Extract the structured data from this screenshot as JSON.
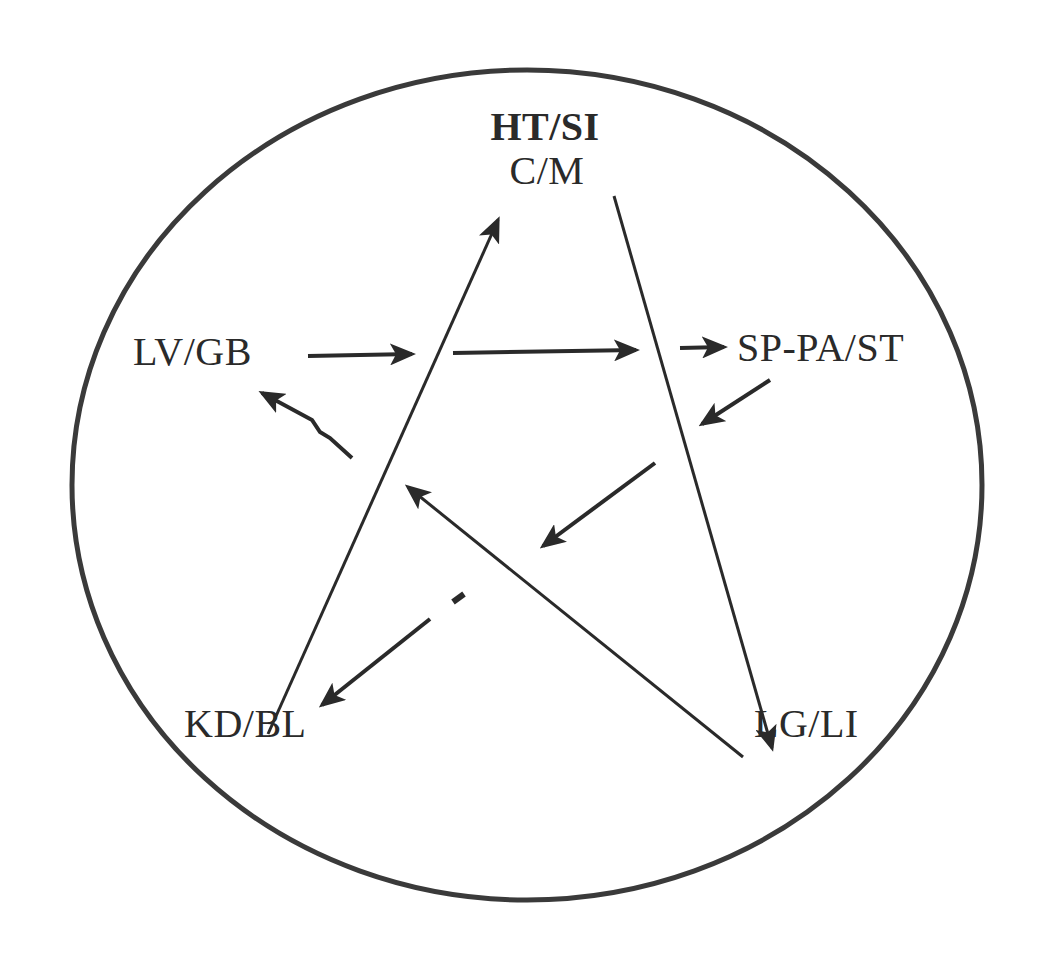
{
  "diagram": {
    "title": "",
    "nodes": {
      "top_line1": "HT/SI",
      "top_line2": "C/M",
      "left": "LV/GB",
      "right": "SP-PA/ST",
      "bottom_left": "KD/BL",
      "bottom_right": "LG/LI"
    },
    "edges": [
      {
        "from": "KD/BL",
        "to": "HT/SI C/M",
        "type": "line-arrow"
      },
      {
        "from": "HT/SI C/M",
        "to": "LG/LI",
        "type": "line-arrow"
      },
      {
        "from": "LG/LI",
        "to": "center-left",
        "type": "line-arrow"
      },
      {
        "from": "LV/GB",
        "to": "SP-PA/ST",
        "type": "segmented-arrow"
      },
      {
        "from": "SP-PA/ST",
        "to": "center",
        "type": "segmented-arrow"
      },
      {
        "from": "center",
        "to": "KD/BL",
        "type": "segmented-arrow"
      },
      {
        "from": "center-left",
        "to": "LV/GB",
        "type": "segmented-arrow"
      }
    ],
    "colors": {
      "ink": "#2a2a2a",
      "background": "#ffffff"
    }
  }
}
